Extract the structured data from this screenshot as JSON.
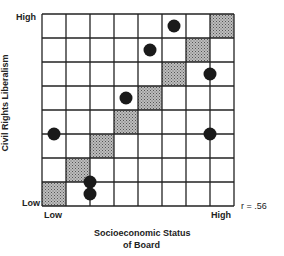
{
  "diagram": {
    "y_axis_label": "Civil Rights Liberalism",
    "x_axis_label_line1": "Socioeconomic Status",
    "x_axis_label_line2": "of Board",
    "y_high": "High",
    "y_low": "Low",
    "x_low": "Low",
    "x_high": "High",
    "correlation": "r = .56",
    "grid": {
      "cols": 8,
      "rows": 8
    },
    "shaded_cells": [
      [
        0,
        0
      ],
      [
        1,
        1
      ],
      [
        2,
        2
      ],
      [
        3,
        3
      ],
      [
        4,
        4
      ],
      [
        5,
        5
      ],
      [
        6,
        6
      ],
      [
        7,
        7
      ]
    ],
    "points": [
      {
        "x": 0.5,
        "y": 3.0
      },
      {
        "x": 2.0,
        "y": 1.0
      },
      {
        "x": 2.0,
        "y": 0.0
      },
      {
        "x": 3.5,
        "y": 4.5
      },
      {
        "x": 4.5,
        "y": 6.5
      },
      {
        "x": 5.5,
        "y": 7.5
      },
      {
        "x": 7.0,
        "y": 5.5
      },
      {
        "x": 7.0,
        "y": 3.0
      }
    ]
  }
}
